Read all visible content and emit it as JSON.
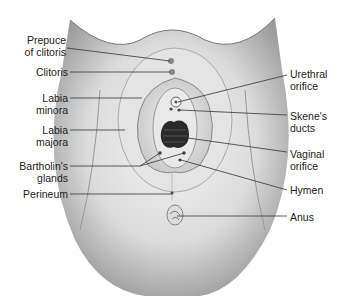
{
  "figure": {
    "type": "anatomical-illustration",
    "labels_left": [
      {
        "line1": "Prepuce",
        "line2": "of clitoris"
      },
      {
        "line1": "Clitoris",
        "line2": ""
      },
      {
        "line1": "Labia",
        "line2": "minora"
      },
      {
        "line1": "Labia",
        "line2": "majora"
      },
      {
        "line1": "Bartholin's",
        "line2": "glands"
      },
      {
        "line1": "Perineum",
        "line2": ""
      }
    ],
    "labels_right": [
      {
        "line1": "Urethral",
        "line2": "orifice"
      },
      {
        "line1": "Skene's",
        "line2": "ducts"
      },
      {
        "line1": "Vaginal",
        "line2": "orifice"
      },
      {
        "line1": "Hymen",
        "line2": ""
      },
      {
        "line1": "Anus",
        "line2": ""
      }
    ]
  }
}
